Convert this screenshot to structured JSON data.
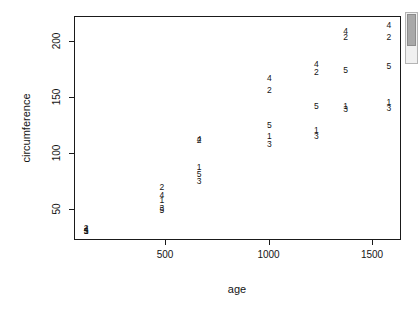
{
  "chart_data": {
    "type": "scatter",
    "title": "",
    "xlabel": "age",
    "ylabel": "circumference",
    "xlim": [
      60,
      1640
    ],
    "ylim": [
      22,
      222
    ],
    "grid": false,
    "legend": "none",
    "point_labels": "Tree number (1-5) used as plotting character",
    "xticks": [
      500,
      1000,
      1500
    ],
    "yticks": [
      50,
      100,
      150,
      200
    ],
    "series": [
      {
        "name": "Tree 1",
        "x": [
          118,
          484,
          664,
          1004,
          1231,
          1372,
          1582
        ],
        "y": [
          30,
          58,
          87,
          115,
          120,
          142,
          145
        ]
      },
      {
        "name": "Tree 2",
        "x": [
          118,
          484,
          664,
          1004,
          1231,
          1372,
          1582
        ],
        "y": [
          33,
          69,
          111,
          156,
          172,
          203,
          203
        ]
      },
      {
        "name": "Tree 3",
        "x": [
          118,
          484,
          664,
          1004,
          1231,
          1372,
          1582
        ],
        "y": [
          30,
          51,
          75,
          108,
          115,
          139,
          140
        ]
      },
      {
        "name": "Tree 4",
        "x": [
          118,
          484,
          664,
          1004,
          1231,
          1372,
          1582
        ],
        "y": [
          32,
          62,
          112,
          167,
          179,
          209,
          214
        ]
      },
      {
        "name": "Tree 5",
        "x": [
          118,
          484,
          664,
          1004,
          1231,
          1372,
          1582
        ],
        "y": [
          30,
          49,
          81,
          125,
          142,
          174,
          177
        ]
      }
    ],
    "points": [
      {
        "label": "1",
        "x": 118,
        "y": 30
      },
      {
        "label": "2",
        "x": 118,
        "y": 33
      },
      {
        "label": "3",
        "x": 118,
        "y": 30
      },
      {
        "label": "4",
        "x": 118,
        "y": 32
      },
      {
        "label": "5",
        "x": 118,
        "y": 30
      },
      {
        "label": "1",
        "x": 484,
        "y": 58
      },
      {
        "label": "2",
        "x": 484,
        "y": 69
      },
      {
        "label": "3",
        "x": 484,
        "y": 51
      },
      {
        "label": "4",
        "x": 484,
        "y": 62
      },
      {
        "label": "5",
        "x": 484,
        "y": 49
      },
      {
        "label": "1",
        "x": 664,
        "y": 87
      },
      {
        "label": "2",
        "x": 664,
        "y": 111
      },
      {
        "label": "3",
        "x": 664,
        "y": 75
      },
      {
        "label": "4",
        "x": 664,
        "y": 112
      },
      {
        "label": "5",
        "x": 664,
        "y": 81
      },
      {
        "label": "1",
        "x": 1004,
        "y": 115
      },
      {
        "label": "2",
        "x": 1004,
        "y": 156
      },
      {
        "label": "3",
        "x": 1004,
        "y": 108
      },
      {
        "label": "4",
        "x": 1004,
        "y": 167
      },
      {
        "label": "5",
        "x": 1004,
        "y": 125
      },
      {
        "label": "1",
        "x": 1231,
        "y": 120
      },
      {
        "label": "2",
        "x": 1231,
        "y": 172
      },
      {
        "label": "3",
        "x": 1231,
        "y": 115
      },
      {
        "label": "4",
        "x": 1231,
        "y": 179
      },
      {
        "label": "5",
        "x": 1231,
        "y": 142
      },
      {
        "label": "1",
        "x": 1372,
        "y": 142
      },
      {
        "label": "2",
        "x": 1372,
        "y": 203
      },
      {
        "label": "3",
        "x": 1372,
        "y": 139
      },
      {
        "label": "4",
        "x": 1372,
        "y": 209
      },
      {
        "label": "5",
        "x": 1372,
        "y": 174
      },
      {
        "label": "1",
        "x": 1582,
        "y": 145
      },
      {
        "label": "2",
        "x": 1582,
        "y": 203
      },
      {
        "label": "3",
        "x": 1582,
        "y": 140
      },
      {
        "label": "4",
        "x": 1582,
        "y": 214
      },
      {
        "label": "5",
        "x": 1582,
        "y": 177
      }
    ]
  },
  "colors": {
    "axis": "#1a1a1a",
    "text": "#141414",
    "background": "#ffffff",
    "scrollbar_track": "#f0f0f0",
    "scrollbar_thumb": "#a8a8a8"
  }
}
